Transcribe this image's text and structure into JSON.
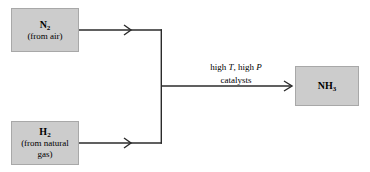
{
  "diagram": {
    "background_color": "#ffffff",
    "box_fill_color": "#cccccc",
    "box_border_color": "#a8a8a8",
    "line_color": "#2b2b2b",
    "reactants": [
      {
        "id": "n2",
        "formula_element": "N",
        "formula_subscript": "2",
        "source_lines": [
          "(from air)"
        ]
      },
      {
        "id": "h2",
        "formula_element": "H",
        "formula_subscript": "2",
        "source_lines": [
          "(from natural",
          "gas)"
        ]
      }
    ],
    "conditions": {
      "line1_pre": "high ",
      "line1_var1": "T",
      "line1_mid": ", high ",
      "line1_var2": "P",
      "line2": "catalysts"
    },
    "product": {
      "id": "nh3",
      "formula_element": "NH",
      "formula_subscript": "3"
    }
  }
}
